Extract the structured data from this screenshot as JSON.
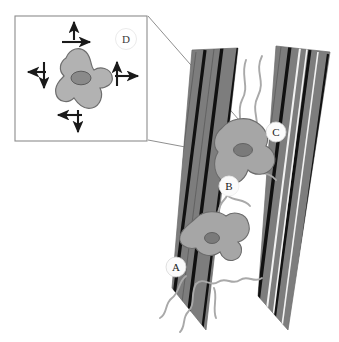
{
  "figure": {
    "type": "scientific-diagram",
    "background_color": "#ffffff"
  },
  "inset": {
    "label": "D",
    "border_color": "#8c8c8c",
    "box": {
      "x": 14,
      "y": 15,
      "width": 134,
      "height": 127
    },
    "cell": {
      "fill_color": "#b2b2b2",
      "outline_color": "#6e6e6e",
      "nucleus_color": "#8a8a8a",
      "nucleus_outline": "#5c5c5c"
    },
    "arrows": {
      "color": "#1a1a1a",
      "items": [
        {
          "name": "arrow-up-top",
          "direction": "up"
        },
        {
          "name": "arrow-right-top",
          "direction": "right"
        },
        {
          "name": "arrow-left-mid",
          "direction": "left"
        },
        {
          "name": "arrow-down-mid",
          "direction": "down"
        },
        {
          "name": "arrow-up-right",
          "direction": "up"
        },
        {
          "name": "arrow-right-right",
          "direction": "right"
        },
        {
          "name": "arrow-left-bottom",
          "direction": "left"
        },
        {
          "name": "arrow-down-bottom",
          "direction": "down"
        }
      ]
    }
  },
  "main": {
    "bands": {
      "fill_color": "#7d7d7d",
      "dark_stripe_color": "#111111",
      "light_stripe_color": "#f2f2f2",
      "left_band_name": "tissue-band-left",
      "right_band_name": "tissue-band-right"
    },
    "cells": [
      {
        "name": "cell-upper",
        "fill_color": "#a6a6a6",
        "outline_color": "#6b6b6b",
        "nucleus_color": "#7a7a7a"
      },
      {
        "name": "cell-lower",
        "fill_color": "#a6a6a6",
        "outline_color": "#6b6b6b",
        "nucleus_color": "#7a7a7a"
      }
    ],
    "filaments": {
      "color": "#a9a9a9",
      "description": "branching wavy cell processes"
    },
    "labels": [
      {
        "id": "A",
        "x": 176,
        "y": 267,
        "circled": true
      },
      {
        "id": "B",
        "x": 229,
        "y": 186,
        "circled": true
      },
      {
        "id": "C",
        "x": 276,
        "y": 132,
        "circled": true
      }
    ]
  },
  "connectors": {
    "color": "#8f8f8f",
    "count": 2,
    "description": "leader lines from inset box to upper cell region"
  }
}
